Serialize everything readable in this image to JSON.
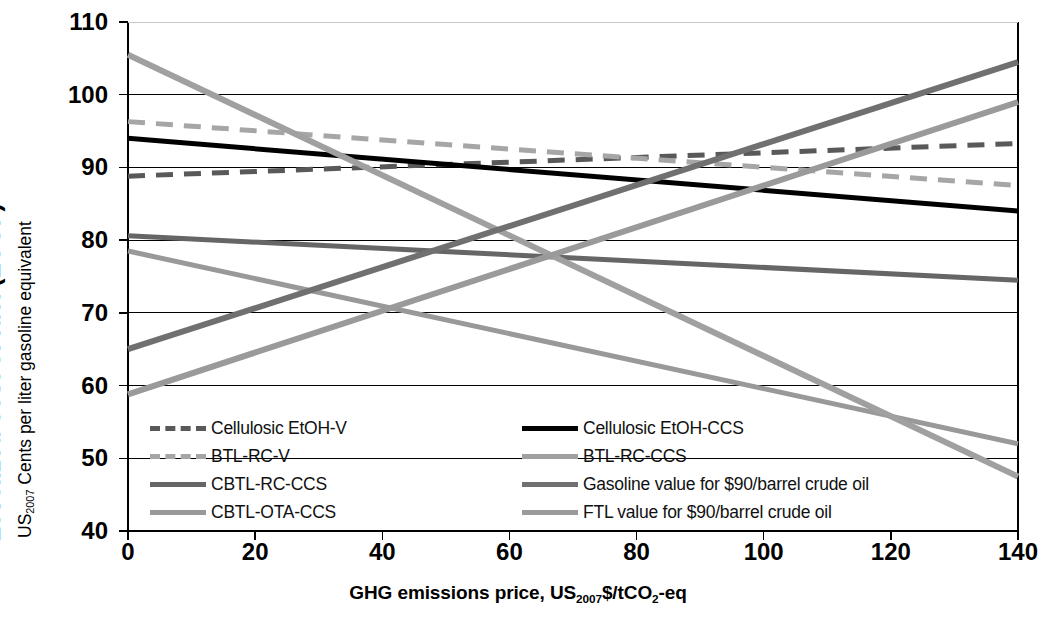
{
  "chart_data": {
    "type": "line",
    "title": "",
    "xlabel": "GHG emissions price, US2007$/tCO2-eq",
    "ylabel": "Levelized cost of fuel (LCOF)",
    "ylabel_sub": "US2007 Cents per liter gasoline equivalent",
    "xlim": [
      0,
      140
    ],
    "ylim": [
      40,
      110
    ],
    "xticks": [
      0,
      20,
      40,
      60,
      80,
      100,
      120,
      140
    ],
    "yticks": [
      40,
      50,
      60,
      70,
      80,
      90,
      100,
      110
    ],
    "grid": "horizontal",
    "legend_position": "inside-bottom-left",
    "x": [
      0,
      140
    ],
    "series": [
      {
        "name": "Cellulosic EtOH-V",
        "values": [
          88.8,
          93.3
        ],
        "color": "#595959",
        "style": "dashed",
        "width": 5
      },
      {
        "name": "BTL-RC-V",
        "values": [
          96.3,
          87.5
        ],
        "color": "#a6a6a6",
        "style": "dashed",
        "width": 5
      },
      {
        "name": "CBTL-RC-CCS",
        "values": [
          80.6,
          74.5
        ],
        "color": "#666666",
        "style": "solid",
        "width": 5
      },
      {
        "name": "CBTL-OTA-CCS",
        "values": [
          78.5,
          52.0
        ],
        "color": "#999999",
        "style": "solid",
        "width": 5
      },
      {
        "name": "Cellulosic EtOH-CCS",
        "values": [
          94.0,
          84.0
        ],
        "color": "#000000",
        "style": "solid",
        "width": 5
      },
      {
        "name": "BTL-RC-CCS",
        "values": [
          105.5,
          47.5
        ],
        "color": "#a0a0a0",
        "style": "solid",
        "width": 6
      },
      {
        "name": "Gasoline value for $90/barrel crude oil",
        "values": [
          65.0,
          104.5
        ],
        "color": "#707070",
        "style": "solid",
        "width": 6
      },
      {
        "name": "FTL value for $90/barrel crude oil",
        "values": [
          58.8,
          99.0
        ],
        "color": "#9a9a9a",
        "style": "solid",
        "width": 6
      }
    ]
  },
  "axis": {
    "y_tick_labels": [
      "110",
      "100",
      "90",
      "80",
      "70",
      "60",
      "50",
      "40"
    ],
    "x_tick_labels": [
      "0",
      "20",
      "40",
      "60",
      "80",
      "100",
      "120",
      "140"
    ],
    "ylabel_main_text": "Levelized cost of fuel (LCOF)",
    "ylabel_sub_prefix": "US",
    "ylabel_sub_subscript": "2007",
    "ylabel_sub_rest": " Cents per liter gasoline equivalent",
    "xlabel_part1": "GHG emissions price, US",
    "xlabel_sub1": "2007",
    "xlabel_part2": "$/tCO",
    "xlabel_sub2": "2",
    "xlabel_part3": "-eq"
  },
  "legend": {
    "left_column": [
      {
        "label": "Cellulosic EtOH-V",
        "color": "#595959",
        "style": "dashed"
      },
      {
        "label": "BTL-RC-V",
        "color": "#a6a6a6",
        "style": "dashed"
      },
      {
        "label": "CBTL-RC-CCS",
        "color": "#666666",
        "style": "solid"
      },
      {
        "label": "CBTL-OTA-CCS",
        "color": "#999999",
        "style": "solid"
      }
    ],
    "right_column": [
      {
        "label": "Cellulosic EtOH-CCS",
        "color": "#000000",
        "style": "solid"
      },
      {
        "label": "BTL-RC-CCS",
        "color": "#a0a0a0",
        "style": "solid"
      },
      {
        "label": "Gasoline value for $90/barrel crude oil",
        "color": "#707070",
        "style": "solid"
      },
      {
        "label": "FTL value for $90/barrel crude oil",
        "color": "#9a9a9a",
        "style": "solid"
      }
    ]
  }
}
